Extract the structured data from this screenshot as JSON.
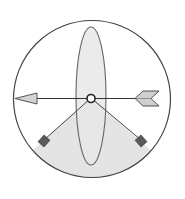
{
  "diagram": {
    "type": "illustration",
    "colors": {
      "background": "#ffffff",
      "outline": "#444444",
      "ellipse_fill": "#e6e6e6",
      "sector_fill": "#e4e4e4",
      "arrowhead_fill": "#d4d4d4",
      "fletching_fill": "#cfcfcf",
      "marker_fill": "#5a5a5a",
      "center_fill": "#ffffff"
    },
    "elements": [
      {
        "name": "outer-circle",
        "shape": "circle"
      },
      {
        "name": "vertical-ellipse",
        "shape": "ellipse"
      },
      {
        "name": "lower-sector",
        "shape": "wedge"
      },
      {
        "name": "horizontal-arrow",
        "shape": "arrow",
        "direction": "left"
      },
      {
        "name": "center-point",
        "shape": "circle"
      },
      {
        "name": "left-marker",
        "shape": "square"
      },
      {
        "name": "right-marker",
        "shape": "square"
      }
    ]
  }
}
